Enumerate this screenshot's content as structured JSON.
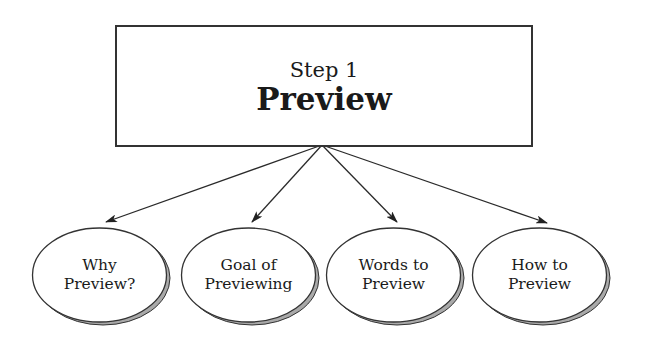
{
  "root": {
    "step_label": "Step 1",
    "title": "Preview"
  },
  "nodes": [
    {
      "line1": "Why",
      "line2": "Preview?"
    },
    {
      "line1": "Goal of",
      "line2": "Previewing"
    },
    {
      "line1": "Words to",
      "line2": "Preview"
    },
    {
      "line1": "How to",
      "line2": "Preview"
    }
  ],
  "colors": {
    "stroke": "#333333",
    "shadow": "#a9a9a9",
    "fill": "#ffffff"
  }
}
